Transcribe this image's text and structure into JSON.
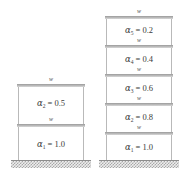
{
  "figure": {
    "load_label": "w",
    "structures": [
      {
        "name": "two-storey-frame",
        "storeys": [
          {
            "label_symbol": "α",
            "subscript": "2",
            "equals": "= 0.5",
            "full": "α₂ = 1.0"
          },
          {
            "label_symbol": "α",
            "subscript": "1",
            "equals": "= 1.0",
            "full": "α₁ = 1.0"
          }
        ]
      },
      {
        "name": "five-storey-frame",
        "storeys": [
          {
            "label_symbol": "α",
            "subscript": "5",
            "equals": "= 0.2"
          },
          {
            "label_symbol": "α",
            "subscript": "4",
            "equals": "= 0.4"
          },
          {
            "label_symbol": "α",
            "subscript": "3",
            "equals": "= 0.6"
          },
          {
            "label_symbol": "α",
            "subscript": "2",
            "equals": "= 0.8"
          },
          {
            "label_symbol": "α",
            "subscript": "1",
            "equals": "= 1.0"
          }
        ]
      }
    ],
    "colors": {
      "beam": "#b5b5b5",
      "column": "#b9b9b9",
      "ground_hatch": "#a8a8a8",
      "text": "#3a3a3a"
    }
  }
}
